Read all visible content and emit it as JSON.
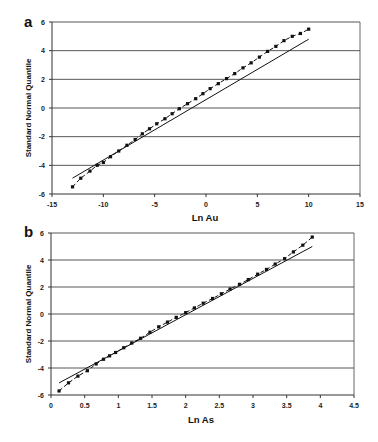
{
  "chart_data": [
    {
      "panel": "a",
      "type": "line",
      "title": "",
      "xlabel": "Ln Au",
      "ylabel": "Standard Normal Quantile",
      "xlim": [
        -15,
        15
      ],
      "ylim": [
        -6,
        6
      ],
      "xticks": [
        -15,
        -10,
        -5,
        0,
        5,
        10,
        15
      ],
      "yticks": [
        -6,
        -4,
        -2,
        0,
        2,
        4,
        6
      ],
      "grid": "horizontal",
      "legend": null,
      "series": [
        {
          "name": "observed",
          "style": "dashed-with-square-markers",
          "x": [
            -13.0,
            -12.2,
            -11.3,
            -10.6,
            -10.0,
            -9.3,
            -8.5,
            -7.7,
            -6.9,
            -6.2,
            -5.5,
            -4.8,
            -4.0,
            -3.3,
            -2.6,
            -1.8,
            -1.0,
            -0.3,
            0.4,
            1.2,
            2.0,
            2.8,
            3.6,
            4.4,
            5.2,
            6.0,
            6.8,
            7.6,
            8.4,
            9.2,
            10.0
          ],
          "y": [
            -5.5,
            -4.9,
            -4.4,
            -4.0,
            -3.8,
            -3.4,
            -3.0,
            -2.6,
            -2.2,
            -1.8,
            -1.45,
            -1.1,
            -0.75,
            -0.4,
            -0.05,
            0.3,
            0.65,
            1.0,
            1.35,
            1.7,
            2.05,
            2.4,
            2.8,
            3.15,
            3.55,
            3.95,
            4.3,
            4.7,
            5.0,
            5.2,
            5.5
          ]
        },
        {
          "name": "fitted",
          "style": "solid",
          "x": [
            -13.0,
            10.0
          ],
          "y": [
            -4.9,
            4.8
          ]
        }
      ]
    },
    {
      "panel": "b",
      "type": "line",
      "title": "",
      "xlabel": "Ln As",
      "ylabel": "Standard Normal Quantile",
      "xlim": [
        0,
        4.5
      ],
      "ylim": [
        -6,
        6
      ],
      "xticks": [
        0,
        0.5,
        1,
        1.5,
        2,
        2.5,
        3,
        3.5,
        4,
        4.5
      ],
      "yticks": [
        -6,
        -4,
        -2,
        0,
        2,
        4,
        6
      ],
      "grid": "horizontal",
      "legend": null,
      "series": [
        {
          "name": "observed",
          "style": "dashed-with-square-markers",
          "x": [
            0.12,
            0.26,
            0.4,
            0.54,
            0.67,
            0.78,
            0.87,
            0.96,
            1.08,
            1.2,
            1.33,
            1.47,
            1.6,
            1.73,
            1.86,
            2.0,
            2.13,
            2.26,
            2.4,
            2.53,
            2.66,
            2.8,
            2.93,
            3.07,
            3.2,
            3.33,
            3.47,
            3.6,
            3.74,
            3.88
          ],
          "y": [
            -5.7,
            -5.1,
            -4.6,
            -4.2,
            -3.7,
            -3.35,
            -3.1,
            -2.85,
            -2.5,
            -2.15,
            -1.8,
            -1.35,
            -0.95,
            -0.6,
            -0.25,
            0.1,
            0.45,
            0.8,
            1.15,
            1.5,
            1.85,
            2.2,
            2.55,
            2.95,
            3.3,
            3.7,
            4.1,
            4.6,
            5.1,
            5.7
          ]
        },
        {
          "name": "fitted",
          "style": "solid",
          "x": [
            0.12,
            3.88
          ],
          "y": [
            -5.1,
            5.0
          ]
        }
      ]
    }
  ],
  "panels": {
    "a": {
      "label": "a",
      "xlabel": "Ln Au",
      "ylabel": "Standard Normal Quantile",
      "xtick_labels": [
        "-15",
        "-10",
        "-5",
        "0",
        "5",
        "10",
        "15"
      ],
      "ytick_labels": [
        "6",
        "4",
        "2",
        "0",
        "-2",
        "-4",
        "-6"
      ]
    },
    "b": {
      "label": "b",
      "xlabel": "Ln As",
      "ylabel": "Standard Normal Quantile",
      "xtick_labels": [
        "0",
        "0.5",
        "1",
        "1.5",
        "2",
        "2.5",
        "3",
        "3.5",
        "4",
        "4.5"
      ],
      "ytick_labels": [
        "6",
        "4",
        "2",
        "0",
        "-2",
        "-4",
        "-6"
      ]
    }
  },
  "colors": {
    "line": "#111111",
    "grid": "#444444",
    "background": "#ffffff"
  }
}
